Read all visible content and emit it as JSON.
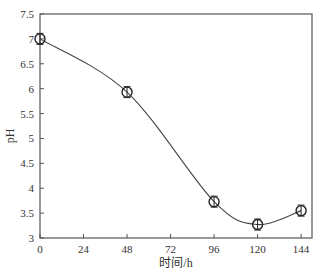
{
  "chart_data": {
    "type": "line",
    "title": "",
    "xlabel": "时间/h",
    "ylabel": "pH",
    "x": [
      0,
      48,
      96,
      120,
      144
    ],
    "series": [
      {
        "name": "pH",
        "values": [
          7.0,
          5.93,
          3.73,
          3.27,
          3.55
        ],
        "error": [
          0.03,
          0.1,
          0.05,
          0.03,
          0.03
        ],
        "marker": "circle-with-bar",
        "line": "smooth"
      }
    ],
    "xlim": [
      0,
      150
    ],
    "ylim": [
      3,
      7.5
    ],
    "xticks": [
      "0",
      "24",
      "48",
      "72",
      "96",
      "120",
      "144"
    ],
    "yticks": [
      "3",
      "3.5",
      "4",
      "4.5",
      "5",
      "5.5",
      "6",
      "6.5",
      "7",
      "7.5"
    ],
    "grid": false,
    "legend": null,
    "colors": {
      "line": "#444444",
      "axis": "#555555"
    }
  }
}
